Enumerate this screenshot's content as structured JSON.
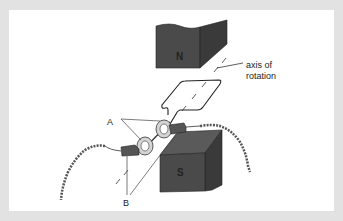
{
  "diagram": {
    "labels": {
      "north_pole": "N",
      "south_pole": "S",
      "axis": "axis of",
      "axis_line2": "rotation",
      "slip_rings": "A",
      "brushes": "B"
    },
    "colors": {
      "frame": "#e2e2e2",
      "panel": "#ffffff",
      "magnet_front": "#4a4a4a",
      "magnet_side": "#3a3a3a",
      "magnet_top": "#5a5a5a",
      "line": "#333333",
      "ring": "#cfcfcf",
      "brush": "#555555"
    }
  }
}
